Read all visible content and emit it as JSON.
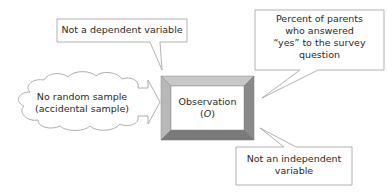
{
  "center_box": {
    "title": "Observation",
    "symbol": "O",
    "bevel_top_color": "#c8c8c8",
    "bevel_left_color": "#b8b8b8",
    "bevel_right_color": "#8a8a8a",
    "bevel_bottom_color": "#7a7a7a"
  },
  "callouts": {
    "top": "Not a dependent variable",
    "right": "Percent of parents who answered “yes” to the survey question",
    "right_lines": [
      "Percent of parents",
      "who answered",
      "“yes” to the survey",
      "question"
    ],
    "bottom_lines": [
      "Not an independent",
      "variable"
    ]
  },
  "cloud": {
    "lines": [
      "No random sample",
      "(accidental sample)"
    ]
  },
  "colors": {
    "stroke": "#9a9a9a",
    "fill": "#ffffff"
  }
}
